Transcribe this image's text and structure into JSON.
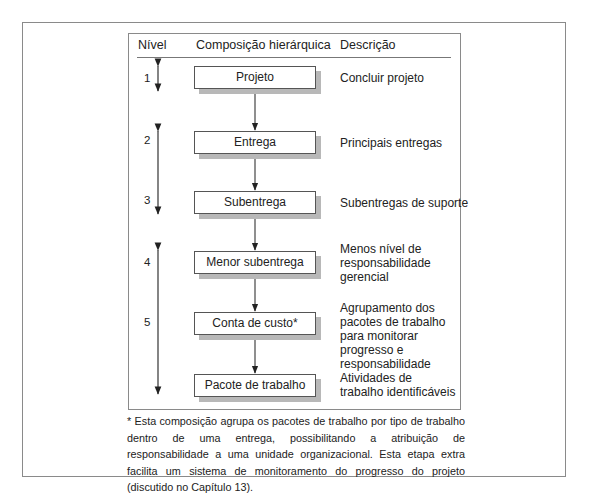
{
  "headers": {
    "level": "Nível",
    "composition": "Composição hierárquica",
    "description": "Descrição"
  },
  "levels": [
    {
      "num": "1"
    },
    {
      "num": "2"
    },
    {
      "num": "3"
    },
    {
      "num": "4"
    },
    {
      "num": "5"
    }
  ],
  "nodes": [
    {
      "label": "Projeto",
      "description": "Concluir projeto"
    },
    {
      "label": "Entrega",
      "description": "Principais entregas"
    },
    {
      "label": "Subentrega",
      "description": "Subentregas de suporte"
    },
    {
      "label": "Menor subentrega",
      "description": "Menos nível de\nresponsabilidade\ngerencial"
    },
    {
      "label": "Conta de custo*",
      "description": "Agrupamento dos\npacotes de trabalho\npara monitorar\nprogresso e\nresponsabilidade"
    },
    {
      "label": "Pacote de trabalho",
      "description": "Atividades de\ntrabalho identificáveis"
    }
  ],
  "footnote": "* Esta composição agrupa os pacotes de trabalho por tipo de trabalho dentro de uma entrega, possibilitando a atribuição de responsabilidade a uma unidade organizacional. Esta etapa extra facilita um sistema de monitoramento do progresso do projeto (discutido no Capítulo 13).",
  "colors": {
    "frame": "#8a8a8a",
    "box_border": "#555555",
    "box_shadow": "#b8b8b8",
    "text": "#222222"
  }
}
